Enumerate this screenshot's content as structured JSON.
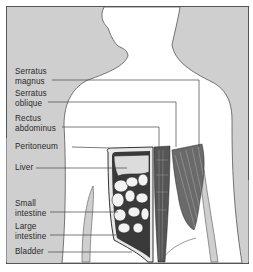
{
  "diagram": {
    "type": "anatomical-illustration",
    "colors": {
      "background_shade": "#cfcfcf",
      "body_fill": "#ffffff",
      "outline": "#555555",
      "leader_line": "#444444",
      "text": "#2a2a2a"
    }
  },
  "labels": [
    {
      "id": "serratus-magnus",
      "lines": [
        "Serratus",
        "magnus"
      ]
    },
    {
      "id": "serratus-oblique",
      "lines": [
        "Serratus",
        "oblique"
      ]
    },
    {
      "id": "rectus-abdominus",
      "lines": [
        "Rectus",
        "abdominus"
      ]
    },
    {
      "id": "peritoneum",
      "lines": [
        "Peritoneum"
      ]
    },
    {
      "id": "liver",
      "lines": [
        "Liver"
      ]
    },
    {
      "id": "small-intestine",
      "lines": [
        "Small",
        "intestine"
      ]
    },
    {
      "id": "large-intestine",
      "lines": [
        "Large",
        "intestine"
      ]
    },
    {
      "id": "bladder",
      "lines": [
        "Bladder"
      ]
    }
  ]
}
